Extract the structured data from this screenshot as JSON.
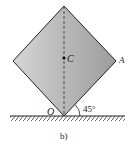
{
  "figure": {
    "caption": "b)",
    "labels": {
      "center": "C",
      "corner": "A",
      "pivot": "O",
      "angle": "45°"
    },
    "colors": {
      "fill_light": "#d8d8d8",
      "fill_dark": "#9a9a9a",
      "stroke": "#222222"
    }
  }
}
